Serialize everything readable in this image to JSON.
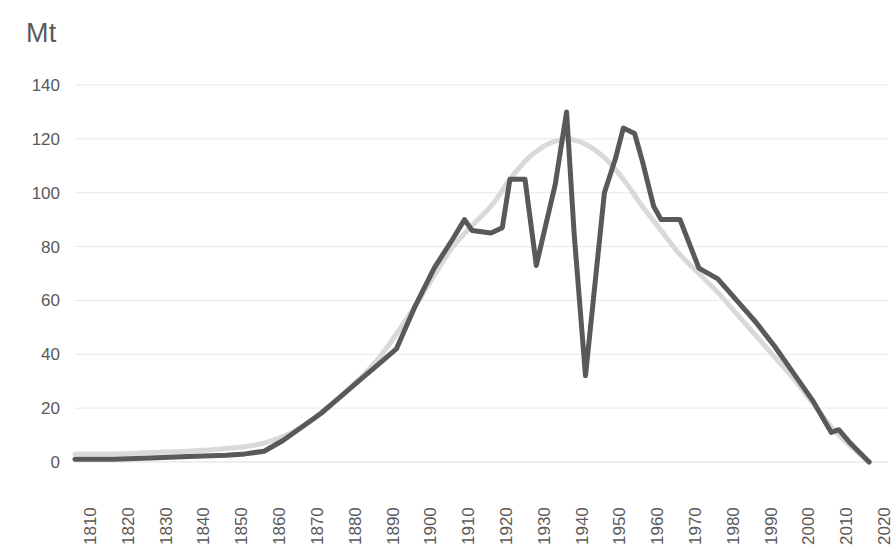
{
  "chart_data": {
    "type": "line",
    "title": "",
    "ylabel": "Mt",
    "xlabel": "",
    "ylim": [
      0,
      140
    ],
    "xlim": [
      1810,
      2025
    ],
    "yticks": [
      0,
      20,
      40,
      60,
      80,
      100,
      120,
      140
    ],
    "xticks": [
      1810,
      1820,
      1830,
      1840,
      1850,
      1860,
      1870,
      1880,
      1890,
      1900,
      1910,
      1920,
      1930,
      1940,
      1950,
      1960,
      1970,
      1980,
      1990,
      2000,
      2010,
      2020
    ],
    "grid": true,
    "legend": "none",
    "colors": {
      "actual": "#595959",
      "trend": "#d9d9d9",
      "gridline": "#e8e8e8",
      "text": "#595959",
      "background": "#ffffff"
    },
    "series": [
      {
        "name": "actual",
        "style": "jagged-line",
        "color": "#595959",
        "points": [
          [
            1810,
            1
          ],
          [
            1820,
            1
          ],
          [
            1830,
            1.5
          ],
          [
            1840,
            2
          ],
          [
            1850,
            2.5
          ],
          [
            1855,
            3
          ],
          [
            1860,
            4
          ],
          [
            1865,
            8
          ],
          [
            1870,
            13
          ],
          [
            1875,
            18
          ],
          [
            1880,
            24
          ],
          [
            1885,
            30
          ],
          [
            1890,
            36
          ],
          [
            1895,
            42
          ],
          [
            1900,
            58
          ],
          [
            1905,
            72
          ],
          [
            1910,
            83
          ],
          [
            1913,
            90
          ],
          [
            1915,
            86
          ],
          [
            1920,
            85
          ],
          [
            1923,
            87
          ],
          [
            1925,
            105
          ],
          [
            1929,
            105
          ],
          [
            1932,
            73
          ],
          [
            1937,
            103
          ],
          [
            1940,
            130
          ],
          [
            1942,
            85
          ],
          [
            1945,
            32
          ],
          [
            1950,
            100
          ],
          [
            1953,
            113
          ],
          [
            1955,
            124
          ],
          [
            1958,
            122
          ],
          [
            1960,
            112
          ],
          [
            1963,
            95
          ],
          [
            1965,
            90
          ],
          [
            1970,
            90
          ],
          [
            1975,
            72
          ],
          [
            1980,
            68
          ],
          [
            1985,
            60
          ],
          [
            1990,
            52
          ],
          [
            1995,
            43
          ],
          [
            2000,
            33
          ],
          [
            2005,
            23
          ],
          [
            2010,
            11
          ],
          [
            2012,
            12
          ],
          [
            2015,
            7
          ],
          [
            2020,
            0
          ]
        ]
      },
      {
        "name": "trend",
        "style": "smooth-curve",
        "color": "#d9d9d9",
        "points": [
          [
            1810,
            3
          ],
          [
            1820,
            3
          ],
          [
            1830,
            3.5
          ],
          [
            1840,
            4
          ],
          [
            1850,
            5
          ],
          [
            1860,
            7
          ],
          [
            1870,
            13
          ],
          [
            1880,
            24
          ],
          [
            1890,
            38
          ],
          [
            1900,
            58
          ],
          [
            1910,
            80
          ],
          [
            1920,
            95
          ],
          [
            1925,
            105
          ],
          [
            1930,
            113
          ],
          [
            1935,
            118
          ],
          [
            1940,
            120
          ],
          [
            1945,
            118
          ],
          [
            1950,
            113
          ],
          [
            1955,
            105
          ],
          [
            1960,
            95
          ],
          [
            1965,
            86
          ],
          [
            1970,
            77
          ],
          [
            1975,
            70
          ],
          [
            1980,
            63
          ],
          [
            1985,
            55
          ],
          [
            1990,
            47
          ],
          [
            1995,
            39
          ],
          [
            2000,
            31
          ],
          [
            2005,
            22
          ],
          [
            2010,
            13
          ],
          [
            2015,
            6
          ],
          [
            2020,
            0
          ]
        ]
      }
    ]
  }
}
